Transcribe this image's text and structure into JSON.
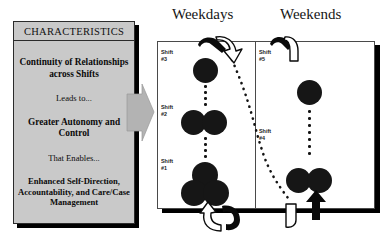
{
  "figure": {
    "left_panel": {
      "title": "CHARACTERISTICS",
      "lines": [
        {
          "text": "Continuity of\nRelationships\nacross Shifts",
          "style": "bold"
        },
        {
          "text": "Leads to...",
          "style": "light"
        },
        {
          "text": "Greater Autonomy\nand Control",
          "style": "bold"
        },
        {
          "text": "That Enables...",
          "style": "light"
        },
        {
          "text": "Enhanced Self-Direction,\nAccountability, and\nCare/Case Management",
          "style": "small-bold"
        }
      ],
      "fill_color": "#c9c9c9",
      "border_color": "#2b2b2b"
    },
    "connector_arrow": {
      "name": "block-arrow-right",
      "fill_color": "#b3b3b3"
    },
    "columns": [
      {
        "heading": "Weekdays"
      },
      {
        "heading": "Weekends"
      }
    ],
    "shifts": [
      {
        "label": "Shift\n#3",
        "column": "Weekdays",
        "staff_count": 1
      },
      {
        "label": "Shift\n#2",
        "column": "Weekdays",
        "staff_count": 2
      },
      {
        "label": "Shift\n#1",
        "column": "Weekdays",
        "staff_count": 3
      },
      {
        "label": "Shift\n#5",
        "column": "Weekends",
        "staff_count": 1
      },
      {
        "label": "Shift\n#4",
        "column": "Weekends",
        "staff_count": 2
      }
    ],
    "circle_color": "#161616",
    "frame_border_color": "#4a4a4a"
  }
}
